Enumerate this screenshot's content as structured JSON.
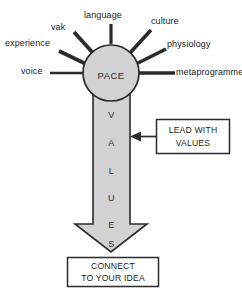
{
  "diagram": {
    "type": "radial-hub-and-arrow",
    "hub": {
      "label": "PACE",
      "fill": "#d2d2d2",
      "stroke": "#2b2b2b"
    },
    "spokes": [
      {
        "label": "language",
        "position": "top"
      },
      {
        "label": "vak",
        "position": "upper-left"
      },
      {
        "label": "experience",
        "position": "left-upper"
      },
      {
        "label": "voice",
        "position": "left"
      },
      {
        "label": "culture",
        "position": "upper-right"
      },
      {
        "label": "physiology",
        "position": "right-upper"
      },
      {
        "label": "metaprogrammes",
        "position": "right"
      }
    ],
    "arrow": {
      "letters": [
        "V",
        "A",
        "L",
        "U",
        "E",
        "S"
      ],
      "word": "VALUES",
      "fill": "#d2d2d2",
      "stroke": "#2b2b2b",
      "direction": "down"
    },
    "callout": {
      "line1": "LEAD WITH",
      "line2": "VALUES",
      "connector": "arrow-left"
    },
    "outcome_box": {
      "line1": "CONNECT",
      "line2": "TO YOUR IDEA"
    },
    "colors": {
      "fill_gray": "#d2d2d2",
      "outline": "#2b2b2b",
      "text": "#1b1b1b",
      "background": "#ffffff"
    }
  }
}
